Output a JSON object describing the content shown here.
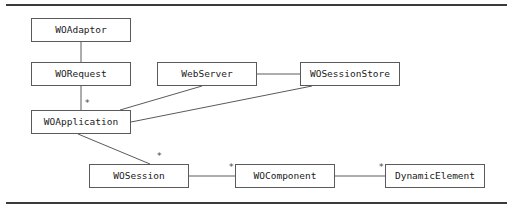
{
  "figure": {
    "type": "uml-class-diagram",
    "title": "",
    "background_color": "#ffffff",
    "line_color": "#5a5a5a",
    "rule_color": "#3a3a3a",
    "text_color": "#1a1a1a",
    "rules": [
      {
        "name": "top-rule",
        "y": 4
      },
      {
        "name": "bottom-rule",
        "y": 202
      }
    ],
    "nodes": [
      {
        "id": "woadaptor",
        "label": "WOAdaptor",
        "x": 31,
        "y": 18,
        "w": 100,
        "h": 24
      },
      {
        "id": "worequest",
        "label": "WORequest",
        "x": 31,
        "y": 62,
        "w": 100,
        "h": 24
      },
      {
        "id": "woapplication",
        "label": "WOApplication",
        "x": 31,
        "y": 110,
        "w": 100,
        "h": 24
      },
      {
        "id": "webserver",
        "label": "WebServer",
        "x": 157,
        "y": 62,
        "w": 100,
        "h": 24
      },
      {
        "id": "wosessionstore",
        "label": "WOSessionStore",
        "x": 300,
        "y": 62,
        "w": 100,
        "h": 24
      },
      {
        "id": "wosession",
        "label": "WOSession",
        "x": 89,
        "y": 164,
        "w": 100,
        "h": 24
      },
      {
        "id": "wocomponent",
        "label": "WOComponent",
        "x": 235,
        "y": 164,
        "w": 100,
        "h": 24
      },
      {
        "id": "dynamicelement",
        "label": "DynamicElement",
        "x": 385,
        "y": 164,
        "w": 100,
        "h": 24
      }
    ],
    "edges": [
      {
        "id": "e-adaptor-request",
        "from": "woadaptor",
        "to": "worequest",
        "x1": 81,
        "y1": 42,
        "x2": 81,
        "y2": 62
      },
      {
        "id": "e-request-application",
        "from": "worequest",
        "to": "woapplication",
        "x1": 81,
        "y1": 86,
        "x2": 81,
        "y2": 110
      },
      {
        "id": "e-webserver-sessionstore",
        "from": "webserver",
        "to": "wosessionstore",
        "x1": 257,
        "y1": 74,
        "x2": 300,
        "y2": 74
      },
      {
        "id": "e-webserver-application",
        "from": "webserver",
        "to": "woapplication",
        "x1": 202,
        "y1": 86,
        "x2": 120,
        "y2": 110
      },
      {
        "id": "e-sessionstore-application",
        "from": "wosessionstore",
        "to": "woapplication",
        "x1": 312,
        "y1": 86,
        "x2": 131,
        "y2": 122
      },
      {
        "id": "e-application-session",
        "from": "woapplication",
        "to": "wosession",
        "x1": 78,
        "y1": 134,
        "x2": 150,
        "y2": 164
      },
      {
        "id": "e-session-component",
        "from": "wosession",
        "to": "wocomponent",
        "x1": 189,
        "y1": 176,
        "x2": 235,
        "y2": 176
      },
      {
        "id": "e-component-dynamic",
        "from": "wocomponent",
        "to": "dynamicelement",
        "x1": 335,
        "y1": 176,
        "x2": 385,
        "y2": 176
      }
    ],
    "multiplicities": [
      {
        "id": "m-application",
        "label": "*",
        "x": 85,
        "y": 99,
        "near": "woapplication"
      },
      {
        "id": "m-session",
        "label": "*",
        "x": 157,
        "y": 152,
        "near": "wosession"
      },
      {
        "id": "m-component",
        "label": "*",
        "x": 229,
        "y": 163,
        "near": "wocomponent"
      },
      {
        "id": "m-dynamic",
        "label": "*",
        "x": 379,
        "y": 163,
        "near": "dynamicelement"
      }
    ]
  }
}
